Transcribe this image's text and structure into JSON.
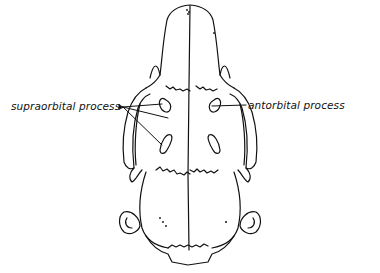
{
  "figure": {
    "labels": [
      {
        "id": "supraorbital",
        "text": "supraorbital process",
        "side": "left",
        "pointers": 3
      },
      {
        "id": "antorbital",
        "text": "antorbital process",
        "side": "right",
        "pointers": 1
      }
    ],
    "colors": {
      "line": "#111111",
      "background": "#ffffff"
    }
  }
}
